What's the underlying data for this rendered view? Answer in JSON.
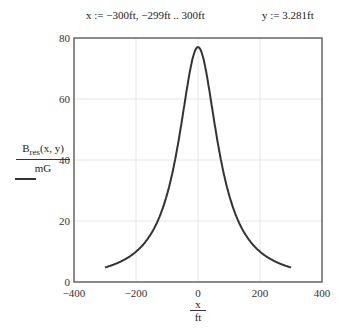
{
  "definitions": {
    "x_range": "x := −300ft, −299ft .. 300ft",
    "y_value": "y := 3.281ft"
  },
  "axis_labels": {
    "y_numerator_main": "B",
    "y_numerator_sub": "res",
    "y_numerator_args": "(x, y)",
    "y_denominator": "mG",
    "x_numerator": "x",
    "x_denominator": "ft"
  },
  "chart_data": {
    "type": "line",
    "title": "",
    "xlabel": "x/ft",
    "ylabel": "B_res(x, y)/mG",
    "xlim": [
      -400,
      400
    ],
    "ylim": [
      0,
      80
    ],
    "xticks": [
      -400,
      -200,
      0,
      200,
      400
    ],
    "yticks": [
      0,
      20,
      40,
      60,
      80
    ],
    "grid": true,
    "series": [
      {
        "name": "B_res(x, y)/mG",
        "color": "#333333",
        "x": [
          -300,
          -250,
          -200,
          -150,
          -100,
          -75,
          -50,
          -25,
          0,
          25,
          50,
          75,
          100,
          150,
          200,
          250,
          300
        ],
        "y": [
          4.8,
          6.7,
          9.9,
          16.0,
          28.7,
          39.5,
          54.2,
          69.6,
          77.0,
          69.6,
          54.2,
          39.5,
          28.7,
          16.0,
          9.9,
          6.7,
          4.8
        ]
      }
    ]
  }
}
